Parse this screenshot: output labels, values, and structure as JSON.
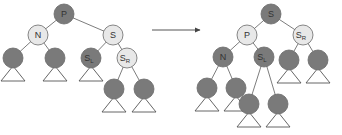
{
  "colors": {
    "black_node": "#7a7a7a",
    "red_node": "#e8e8e8",
    "stroke": "#6e6e6e",
    "arrow": "#555555"
  },
  "radius": 10,
  "trees": [
    {
      "name": "before",
      "nodes": [
        {
          "id": "P",
          "label": "P",
          "sub": "",
          "x": 64,
          "y": 14,
          "color": "black"
        },
        {
          "id": "N",
          "label": "N",
          "sub": "",
          "x": 38,
          "y": 35,
          "color": "red"
        },
        {
          "id": "S",
          "label": "S",
          "sub": "",
          "x": 113,
          "y": 35,
          "color": "red"
        },
        {
          "id": "NL",
          "label": "",
          "sub": "",
          "x": 13,
          "y": 58,
          "color": "black",
          "subtree": true
        },
        {
          "id": "NR",
          "label": "",
          "sub": "",
          "x": 55,
          "y": 58,
          "color": "black",
          "subtree": true
        },
        {
          "id": "SL",
          "label": "S",
          "sub": "L",
          "x": 91,
          "y": 58,
          "color": "black",
          "subtree": true
        },
        {
          "id": "SR",
          "label": "S",
          "sub": "R",
          "x": 127,
          "y": 58,
          "color": "red"
        },
        {
          "id": "SRL",
          "label": "",
          "sub": "",
          "x": 114,
          "y": 89,
          "color": "black",
          "subtree": true
        },
        {
          "id": "SRR",
          "label": "",
          "sub": "",
          "x": 144,
          "y": 89,
          "color": "black",
          "subtree": true
        }
      ],
      "edges": [
        [
          "P",
          "N"
        ],
        [
          "P",
          "S"
        ],
        [
          "N",
          "NL"
        ],
        [
          "N",
          "NR"
        ],
        [
          "S",
          "SL"
        ],
        [
          "S",
          "SR"
        ],
        [
          "SR",
          "SRL"
        ],
        [
          "SR",
          "SRR"
        ]
      ]
    },
    {
      "name": "after",
      "nodes": [
        {
          "id": "S",
          "label": "S",
          "sub": "",
          "x": 271,
          "y": 14,
          "color": "black"
        },
        {
          "id": "P",
          "label": "P",
          "sub": "",
          "x": 247,
          "y": 35,
          "color": "red"
        },
        {
          "id": "SR",
          "label": "S",
          "sub": "R",
          "x": 303,
          "y": 35,
          "color": "red"
        },
        {
          "id": "N",
          "label": "N",
          "sub": "",
          "x": 223,
          "y": 57,
          "color": "black"
        },
        {
          "id": "SL",
          "label": "S",
          "sub": "L",
          "x": 264,
          "y": 57,
          "color": "black"
        },
        {
          "id": "SRL",
          "label": "",
          "sub": "",
          "x": 289,
          "y": 60,
          "color": "black",
          "subtree": true
        },
        {
          "id": "SRR",
          "label": "",
          "sub": "",
          "x": 318,
          "y": 60,
          "color": "black",
          "subtree": true
        },
        {
          "id": "NL",
          "label": "",
          "sub": "",
          "x": 207,
          "y": 88,
          "color": "black",
          "subtree": true
        },
        {
          "id": "NR",
          "label": "",
          "sub": "",
          "x": 236,
          "y": 88,
          "color": "black",
          "subtree": true
        },
        {
          "id": "SLL",
          "label": "",
          "sub": "",
          "x": 249,
          "y": 104,
          "color": "black",
          "subtree": true
        },
        {
          "id": "SLR",
          "label": "",
          "sub": "",
          "x": 278,
          "y": 104,
          "color": "black",
          "subtree": true
        }
      ],
      "edges": [
        [
          "S",
          "P"
        ],
        [
          "S",
          "SR"
        ],
        [
          "P",
          "N"
        ],
        [
          "P",
          "SL"
        ],
        [
          "SR",
          "SRL"
        ],
        [
          "SR",
          "SRR"
        ],
        [
          "N",
          "NL"
        ],
        [
          "N",
          "NR"
        ],
        [
          "SL",
          "SLL"
        ],
        [
          "SL",
          "SLR"
        ]
      ]
    }
  ],
  "arrow": {
    "x1": 152,
    "y1": 30,
    "x2": 200,
    "y2": 30
  }
}
